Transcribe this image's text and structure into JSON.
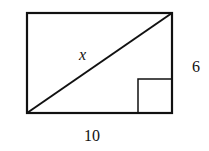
{
  "diagram": {
    "type": "rectangle-with-diagonal",
    "labels": {
      "diagonal": "x",
      "height": "6",
      "width": "10"
    },
    "right_angle_marker": true,
    "stroke_color": "#111111"
  }
}
